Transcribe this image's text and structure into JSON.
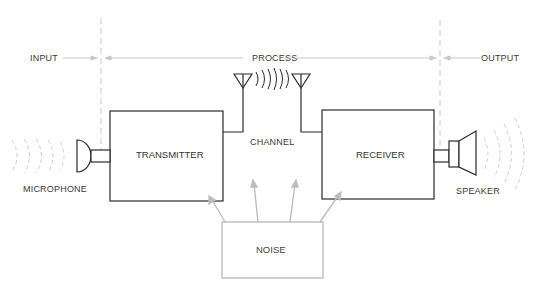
{
  "stages": {
    "input": "INPUT",
    "process": "PROCESS",
    "output": "OUTPUT"
  },
  "blocks": {
    "transmitter": "TRANSMITTER",
    "receiver": "RECEIVER",
    "noise": "NOISE",
    "channel": "CHANNEL"
  },
  "devices": {
    "microphone": "MICROPHONE",
    "speaker": "SPEAKER"
  },
  "colors": {
    "line": "#2a2a2a",
    "faint": "#c8c8c8",
    "noise": "#bdbdbd"
  }
}
